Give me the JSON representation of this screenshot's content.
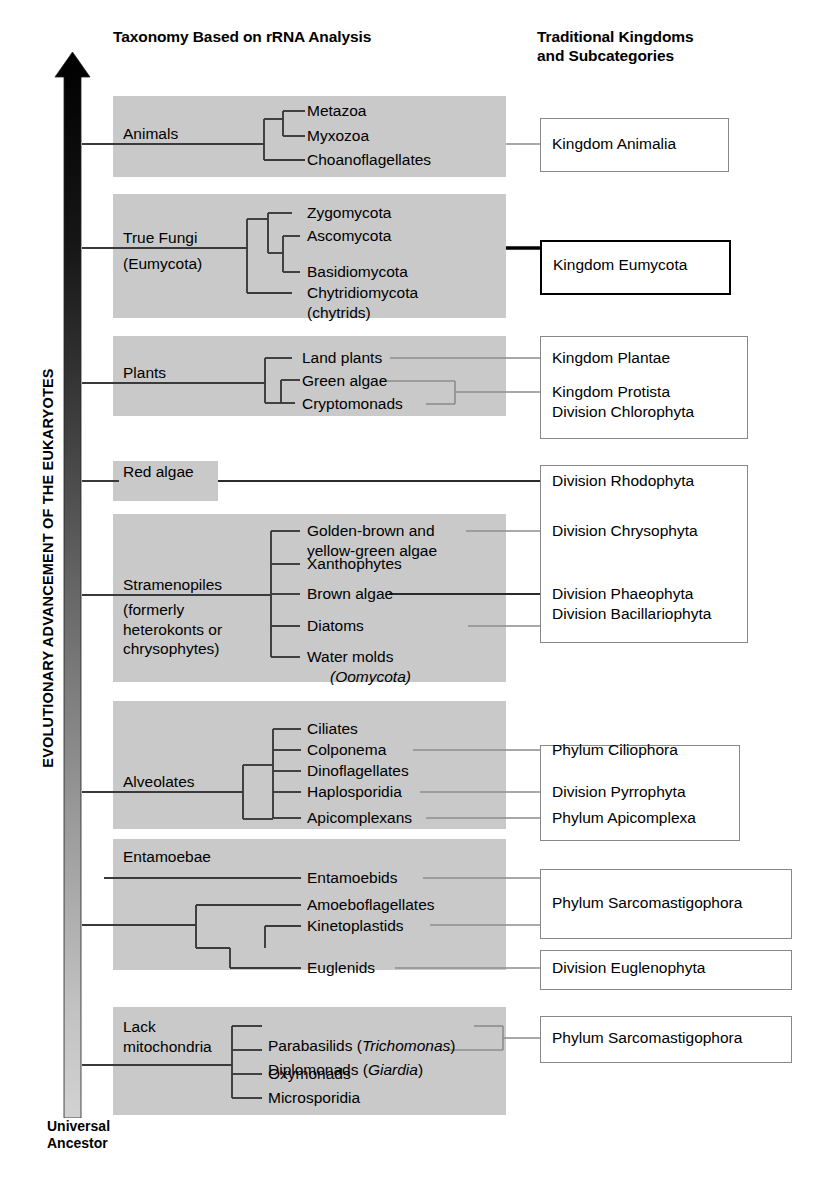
{
  "headers": {
    "left": "Taxonomy Based on rRNA Analysis",
    "right": "Traditional Kingdoms\nand Subcategories"
  },
  "axis": {
    "caption": "EVOLUTIONARY ADVANCEMENT OF THE EUKARYOTES",
    "bottom_label": "Universal\nAncestor",
    "arrow_direction": "up",
    "gradient_top_color": "#000000",
    "gradient_bottom_color": "#cfcfcf"
  },
  "colors": {
    "band": "#c9c9c9",
    "band_light": "#d4d4d4",
    "line": "#3a3a3a",
    "thin_line": "#9a9a9a",
    "box_border": "#888888",
    "box_border_bold": "#000000"
  },
  "clades": [
    {
      "name": "Animals",
      "label": "Animals",
      "tips": [
        "Metazoa",
        "Myxozoa",
        "Choanoflagellates"
      ]
    },
    {
      "name": "True Fungi",
      "label": "True Fungi\n(Eumycota)",
      "tips": [
        "Zygomycota",
        "Ascomycota",
        "Basidiomycota",
        "Chytridiomycota\n(chytrids)"
      ]
    },
    {
      "name": "Plants",
      "label": "Plants",
      "tips": [
        "Land plants",
        "Green algae",
        "Cryptomonads"
      ]
    },
    {
      "name": "Red algae",
      "label": "Red algae",
      "tips": []
    },
    {
      "name": "Stramenopiles",
      "label": "Stramenopiles\n(formerly\nheterokonts or\nchrysophytes)",
      "tips": [
        "Golden-brown and\nyellow-green algae",
        "Xanthophytes",
        "Brown algae",
        "Diatoms",
        "Water molds\n(Oomycota)"
      ]
    },
    {
      "name": "Alveolates",
      "label": "Alveolates",
      "tips": [
        "Ciliates",
        "Colponema",
        "Dinoflagellates",
        "Haplosporidia",
        "Apicomplexans"
      ]
    },
    {
      "name": "Entamoebae",
      "label": "Entamoebae",
      "tips": [
        "Entamoebids"
      ]
    },
    {
      "name": "Euglenozoa",
      "label": "",
      "tips": [
        "Amoeboflagellates",
        "Kinetoplastids",
        "Euglenids"
      ]
    },
    {
      "name": "Lack mitochondria",
      "label": "Lack\nmitochondria",
      "tips": [
        "Parabasilids (Trichomonas)",
        "Diplomonads (Giardia)",
        "Oxymonads",
        "Microsporidia"
      ]
    }
  ],
  "tips": {
    "metazoa": "Metazoa",
    "myxozoa": "Myxozoa",
    "choanoflagellates": "Choanoflagellates",
    "zygomycota": "Zygomycota",
    "ascomycota": "Ascomycota",
    "basidiomycota": "Basidiomycota",
    "chytridiomycota": "Chytridiomycota\n(chytrids)",
    "land_plants": "Land plants",
    "green_algae": "Green algae",
    "cryptomonads": "Cryptomonads",
    "golden_brown": "Golden-brown and\n  yellow-green algae",
    "xanthophytes": "Xanthophytes",
    "brown_algae": "Brown algae",
    "diatoms": "Diatoms",
    "water_molds_1": "Water molds",
    "water_molds_2": "(Oomycota)",
    "ciliates": "Ciliates",
    "colponema": "Colponema",
    "dinoflagellates": "Dinoflagellates",
    "haplosporidia": "Haplosporidia",
    "apicomplexans": "Apicomplexans",
    "entamoebids": "Entamoebids",
    "amoeboflagellates": "Amoeboflagellates",
    "kinetoplastids": "Kinetoplastids",
    "euglenids": "Euglenids",
    "parabasilids_pre": "Parabasilids (",
    "parabasilids_it": "Trichomonas",
    "parabasilids_post": ")",
    "diplomonads_pre": "Diplomonads (",
    "diplomonads_it": "Giardia",
    "diplomonads_post": ")",
    "oxymonads": "Oxymonads",
    "microsporidia": "Microsporidia"
  },
  "clade_labels": {
    "animals": "Animals",
    "true_fungi_1": "True Fungi",
    "true_fungi_2": "(Eumycota)",
    "plants": "Plants",
    "red_algae": "Red algae",
    "stramenopiles": "Stramenopiles",
    "stramenopiles_note": "(formerly\nheterokonts or\nchrysophytes)",
    "alveolates": "Alveolates",
    "entamoebae": "Entamoebae",
    "lack_mitochondria": "Lack\nmitochondria"
  },
  "right_boxes": [
    {
      "id": "animalia",
      "lines": "Kingdom Animalia",
      "bold": false
    },
    {
      "id": "eumycota",
      "lines": "Kingdom Eumycota",
      "bold": true
    },
    {
      "id": "plantae",
      "lines": "Kingdom Plantae",
      "bold": false
    },
    {
      "id": "protista",
      "lines": "Kingdom Protista\nDivision Chlorophyta",
      "bold": false
    },
    {
      "id": "rhodophyta",
      "lines": "Division Rhodophyta",
      "bold": false
    },
    {
      "id": "chrysophyta",
      "lines": "Division Chrysophyta",
      "bold": false
    },
    {
      "id": "phaeophyta",
      "lines": "Division Phaeophyta\nDivision Bacillariophyta",
      "bold": false
    },
    {
      "id": "ciliophora",
      "lines": "Phylum Ciliophora",
      "bold": false
    },
    {
      "id": "pyrrophyta",
      "lines": "Division Pyrrophyta",
      "bold": false
    },
    {
      "id": "apicomplexa",
      "lines": "Phylum Apicomplexa",
      "bold": false
    },
    {
      "id": "sarco1",
      "lines": "Phylum Sarcomastigophora",
      "bold": false
    },
    {
      "id": "euglenophyta",
      "lines": "Division Euglenophyta",
      "bold": false
    },
    {
      "id": "sarco2",
      "lines": "Phylum Sarcomastigophora",
      "bold": false
    }
  ],
  "right_text": {
    "animalia": "Kingdom Animalia",
    "eumycota": "Kingdom Eumycota",
    "plantae": "Kingdom Plantae",
    "protista": "Kingdom Protista\nDivision Chlorophyta",
    "rhodophyta": "Division Rhodophyta",
    "chrysophyta": "Division Chrysophyta",
    "phaeophyta": "Division Phaeophyta\nDivision Bacillariophyta",
    "ciliophora": "Phylum Ciliophora",
    "pyrrophyta": "Division Pyrrophyta",
    "apicomplexa": "Phylum Apicomplexa",
    "sarco1": "Phylum Sarcomastigophora",
    "euglenophyta": "Division Euglenophyta",
    "sarco2": "Phylum Sarcomastigophora"
  }
}
